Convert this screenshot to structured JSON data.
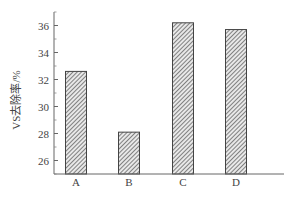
{
  "chart_data": {
    "type": "bar",
    "title": "",
    "xlabel": "",
    "ylabel": "VS去除率/%",
    "categories": [
      "A",
      "B",
      "C",
      "D"
    ],
    "values": [
      32.6,
      28.1,
      36.2,
      35.7
    ],
    "ylim": [
      25,
      37
    ],
    "yticks": [
      26,
      28,
      30,
      32,
      34,
      36
    ],
    "grid": false,
    "legend": null,
    "bar_pattern": "diagonal-hatch",
    "bar_color": "#555555"
  },
  "axis": {
    "ytick_labels": [
      "26",
      "28",
      "30",
      "32",
      "34",
      "36"
    ]
  }
}
